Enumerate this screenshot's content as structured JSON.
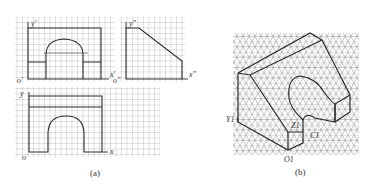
{
  "figure": {
    "panel_a": {
      "caption": "(a)",
      "front_view": {
        "axis_y_label": "y'",
        "axis_x_label": "x'",
        "origin_label": "o'"
      },
      "side_view": {
        "axis_y_label": "y\"",
        "axis_x_label": "x\"",
        "origin_label": "o\""
      },
      "top_view": {
        "axis_y_label": "y",
        "axis_x_label": "x",
        "origin_label": "o"
      }
    },
    "panel_b": {
      "caption": "(b)",
      "labels": {
        "y1": "Y1",
        "z1": "Z1",
        "x1": "C1",
        "o1": "O1"
      }
    },
    "colors": {
      "grid": "#9a9a9a",
      "outline": "#2a2a2a",
      "background": "#ffffff"
    }
  }
}
